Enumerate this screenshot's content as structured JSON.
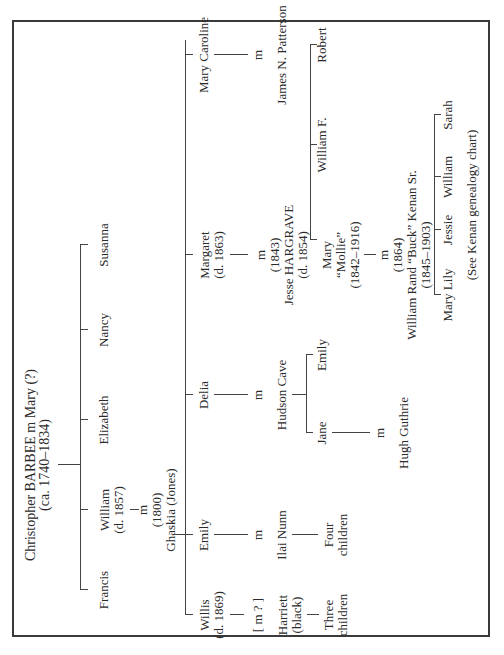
{
  "chart": {
    "root": {
      "line1": "Christopher BARBEE m Mary (?)",
      "line2": "(ca. 1740–1834)"
    },
    "gen2": [
      {
        "name": "Francis"
      },
      {
        "name": "William",
        "dates": "(d. 1857)",
        "marriage": "m",
        "marriage_year": "(1800)",
        "spouse": "Ghaskia (Jones)"
      },
      {
        "name": "Elizabeth"
      },
      {
        "name": "Nancy"
      },
      {
        "name": "Susanna"
      }
    ],
    "gen3": [
      {
        "name": "Willis",
        "dates": "(d. 1869)",
        "marriage": "[ m ? ]",
        "spouse": "Harriett",
        "spouse_note": "(black)",
        "children1": "Three",
        "children2": "children"
      },
      {
        "name": "Emily",
        "marriage": "m",
        "spouse": "Ilai Nunn",
        "children1": "Four",
        "children2": "children"
      },
      {
        "name": "Delia",
        "marriage": "m",
        "spouse": "Hudson Cave"
      },
      {
        "name": "Margaret",
        "dates": "(d. 1863)",
        "marriage": "m",
        "marriage_year": "(1843)",
        "spouse": "Jesse HARGRAVE",
        "spouse_dates": "(d. 1854)"
      },
      {
        "name": "Mary Caroline",
        "marriage": "m",
        "spouse": "James N. Patterson"
      }
    ],
    "cave_children": [
      {
        "name": "Jane",
        "marriage": "m",
        "spouse": "Hugh Guthrie"
      },
      {
        "name": "Emily"
      }
    ],
    "hargrave_children": [
      {
        "name": "Mary",
        "nickname": "“Mollie”",
        "dates": "(1842–1916)",
        "marriage": "m",
        "marriage_year": "(1864)",
        "spouse": "William Rand “Buck” Kenan Sr.",
        "spouse_dates": "(1845–1903)"
      },
      {
        "name": "William F."
      },
      {
        "name": "Robert"
      }
    ],
    "kenan_children": [
      {
        "name": "Mary Lily"
      },
      {
        "name": "Jessie"
      },
      {
        "name": "William"
      },
      {
        "name": "Sarah"
      }
    ],
    "note": "(See Kenan genealogy chart)"
  }
}
